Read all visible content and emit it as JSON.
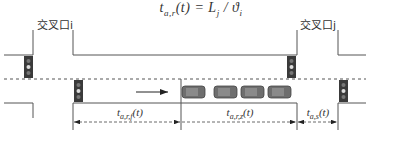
{
  "formula": {
    "lhs": "t",
    "lhs_sub": "a,r",
    "lhs_arg": "(t)",
    "equals": " = ",
    "rhs": "L",
    "rhs_sub": "j",
    "slash": " / ",
    "rhs2": "ϑ",
    "rhs2_sub": "i"
  },
  "intersections": [
    {
      "label": "交叉口i"
    },
    {
      "label": "交叉口j"
    }
  ],
  "dimensions": [
    {
      "label": "t",
      "sub": "a,r,f",
      "arg": "(t)"
    },
    {
      "label": "t",
      "sub": "a,r,z",
      "arg": "(t)"
    },
    {
      "label": "t",
      "sub": "a,s",
      "arg": "(t)"
    }
  ],
  "direction_arrow": "→",
  "vehicles_queued": 4,
  "colors": {
    "line": "#555555",
    "signal_body": "#3a3a3a",
    "vehicle": "#6e6e6e"
  }
}
